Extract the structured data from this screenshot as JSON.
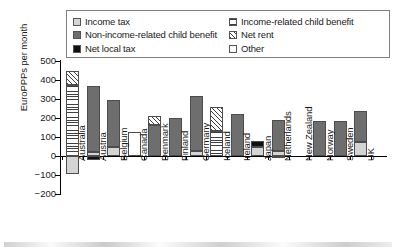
{
  "chart_data": {
    "type": "bar",
    "stacked": true,
    "title": "",
    "xlabel": "",
    "ylabel": "EuroPPPs per month",
    "ylim": [
      -200,
      500
    ],
    "ytick_values": [
      500,
      400,
      300,
      200,
      100,
      0,
      -100,
      -200
    ],
    "ytick_labels": [
      "500",
      "400",
      "300",
      "200",
      "100",
      "0",
      "−100",
      "−200"
    ],
    "grid": false,
    "legend_position": "top-inside",
    "categories": [
      "Australia",
      "Austria",
      "Belgium",
      "Canada",
      "Denmark",
      "Finland",
      "Germany",
      "Iceland",
      "Ireland",
      "Japan",
      "Netherlands",
      "New Zealand",
      "Norway",
      "Sweden",
      "UK"
    ],
    "series": [
      {
        "name": "Income tax",
        "key": "income-tax",
        "color": "#d4d4d4",
        "pattern": "solid-light-gray",
        "values": [
          -95,
          22,
          45,
          0,
          0,
          0,
          26,
          0,
          0,
          48,
          28,
          0,
          0,
          0,
          72
        ]
      },
      {
        "name": "Non-income-related child benefit",
        "key": "non-income-related-child-benefit",
        "color": "#6e6e6e",
        "pattern": "solid-dark-gray",
        "values": [
          0,
          349,
          252,
          0,
          165,
          198,
          290,
          0,
          220,
          0,
          160,
          0,
          184,
          184,
          165
        ]
      },
      {
        "name": "Net local tax",
        "key": "net-local-tax",
        "color": "#101010",
        "pattern": "solid-black",
        "values": [
          0,
          -22,
          0,
          0,
          0,
          0,
          0,
          0,
          0,
          31,
          -6,
          0,
          0,
          0,
          0
        ]
      },
      {
        "name": "Income-related child benefit",
        "key": "income-related-child-benefit",
        "color": "#3f3f3f",
        "pattern": "horizontal-lines",
        "values": [
          372,
          0,
          0,
          0,
          0,
          0,
          0,
          134,
          0,
          0,
          0,
          0,
          0,
          0,
          0
        ]
      },
      {
        "name": "Net rent",
        "key": "net-rent",
        "color": "#3f3f3f",
        "pattern": "diagonal-hatch",
        "values": [
          78,
          0,
          0,
          0,
          44,
          0,
          0,
          124,
          0,
          0,
          0,
          0,
          0,
          0,
          0
        ]
      },
      {
        "name": "Other",
        "key": "other",
        "color": "#ffffff",
        "pattern": "empty-white",
        "values": [
          0,
          0,
          0,
          128,
          0,
          0,
          0,
          0,
          0,
          0,
          0,
          0,
          0,
          0,
          0
        ]
      }
    ],
    "bar_totals_positive": [
      450,
      371,
      297,
      128,
      209,
      198,
      316,
      258,
      220,
      79,
      188,
      0,
      184,
      184,
      237
    ],
    "legend_entries": [
      {
        "label": "Income tax",
        "key": "income-tax",
        "column": 1
      },
      {
        "label": "Non-income-related child benefit",
        "key": "non-income-related-child-benefit",
        "column": 1
      },
      {
        "label": "Net local tax",
        "key": "net-local-tax",
        "column": 1
      },
      {
        "label": "Income-related child benefit",
        "key": "income-related-child-benefit",
        "column": 2
      },
      {
        "label": "Net rent",
        "key": "net-rent",
        "column": 2
      },
      {
        "label": "Other",
        "key": "other",
        "column": 2
      }
    ]
  }
}
